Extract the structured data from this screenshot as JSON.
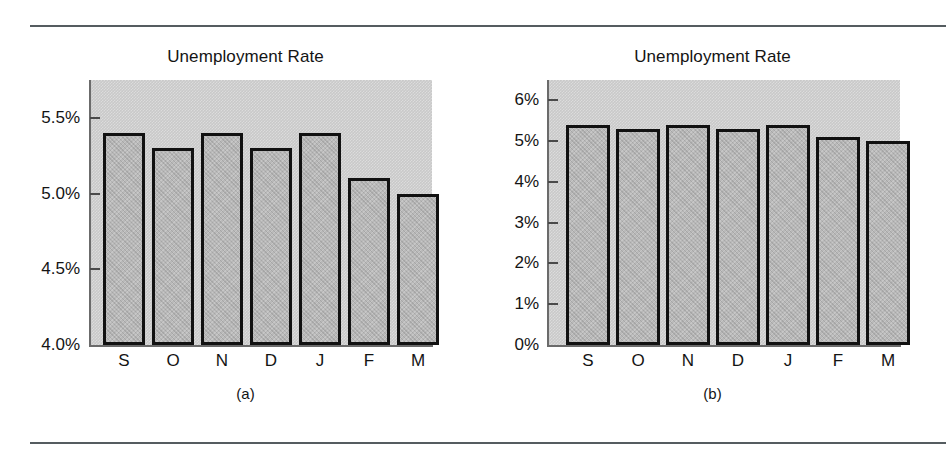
{
  "figure": {
    "rules": [
      "top-rule",
      "bottom-rule"
    ],
    "panels": [
      {
        "caption": "(a)"
      },
      {
        "caption": "(b)"
      }
    ]
  },
  "chart_data": [
    {
      "type": "bar",
      "panel": "(a)",
      "title": "Unemployment Rate",
      "categories": [
        "S",
        "O",
        "N",
        "D",
        "J",
        "F",
        "M"
      ],
      "values": [
        5.4,
        5.3,
        5.4,
        5.3,
        5.4,
        5.1,
        5.0
      ],
      "ytick_labels": [
        "5.5%",
        "5.0%",
        "4.5%",
        "4.0%"
      ],
      "ytick_values": [
        5.5,
        5.0,
        4.5,
        4.0
      ],
      "ylim": [
        4.0,
        5.75
      ],
      "xlabel": "",
      "ylabel": "",
      "grid": false,
      "legend": "none",
      "bar_facecolor": "#b9b9b9",
      "bar_edgecolor": "#111111",
      "plot_bgcolor": "#c9c9c9"
    },
    {
      "type": "bar",
      "panel": "(b)",
      "title": "Unemployment Rate",
      "categories": [
        "S",
        "O",
        "N",
        "D",
        "J",
        "F",
        "M"
      ],
      "values": [
        5.4,
        5.3,
        5.4,
        5.3,
        5.4,
        5.1,
        5.0
      ],
      "ytick_labels": [
        "6%",
        "5%",
        "4%",
        "3%",
        "2%",
        "1%",
        "0%"
      ],
      "ytick_values": [
        6,
        5,
        4,
        3,
        2,
        1,
        0
      ],
      "ylim": [
        0,
        6.5
      ],
      "xlabel": "",
      "ylabel": "",
      "grid": false,
      "legend": "none",
      "bar_facecolor": "#b9b9b9",
      "bar_edgecolor": "#111111",
      "plot_bgcolor": "#c9c9c9"
    }
  ]
}
